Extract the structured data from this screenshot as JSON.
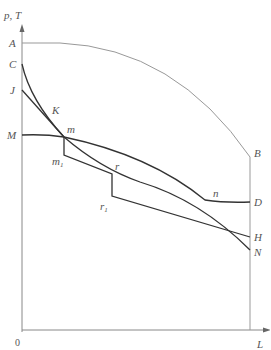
{
  "diagram": {
    "y_axis_label": "p, T",
    "x_axis_label": "L",
    "origin_label": "0",
    "left_labels": {
      "A": "A",
      "C": "C",
      "J": "J",
      "M": "M"
    },
    "right_labels": {
      "B": "B",
      "D": "D",
      "H": "H",
      "N": "N"
    },
    "point_labels": {
      "K": "K",
      "m": "m",
      "m1": "m",
      "m1_sub": "1",
      "r": "r",
      "r1": "r",
      "r1_sub": "1",
      "n": "n"
    },
    "curves": [
      {
        "name": "A-B arc",
        "from": "A",
        "to": "B"
      },
      {
        "name": "C-N curve",
        "from": "C",
        "through": [
          "K",
          "m",
          "r",
          "n"
        ],
        "to": "N"
      },
      {
        "name": "J-m line",
        "from": "J",
        "to": "m"
      },
      {
        "name": "M-D curve",
        "from": "M",
        "through": [
          "m",
          "n"
        ],
        "to": "D"
      },
      {
        "name": "step line",
        "from": "m",
        "through": [
          "m1",
          "r",
          "r1"
        ],
        "to": "H"
      }
    ]
  }
}
